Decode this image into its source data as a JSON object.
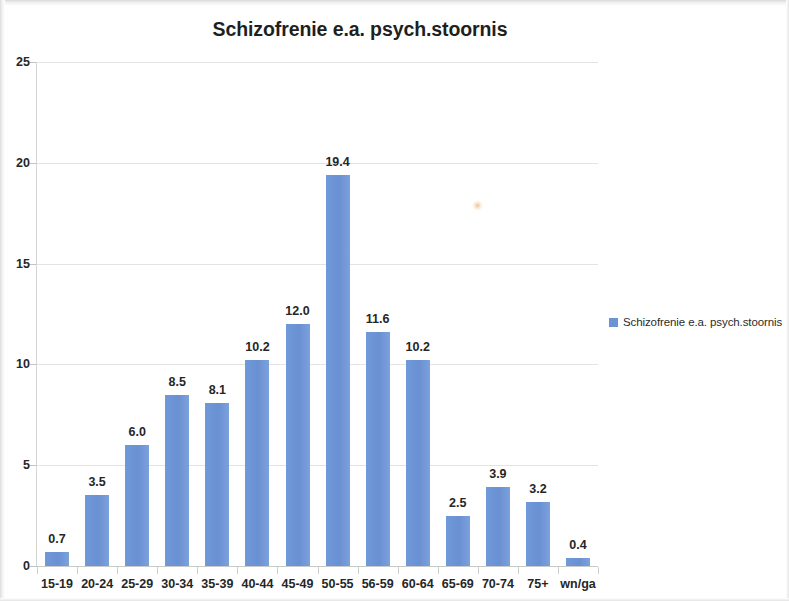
{
  "chart_data": {
    "type": "bar",
    "title": "Schizofrenie e.a. psych.stoornis",
    "xlabel": "",
    "ylabel": "",
    "categories": [
      "15-19",
      "20-24",
      "25-29",
      "30-34",
      "35-39",
      "40-44",
      "45-49",
      "50-55",
      "56-59",
      "60-64",
      "65-69",
      "70-74",
      "75+",
      "wn/ga"
    ],
    "values": [
      0.7,
      3.5,
      6.0,
      8.5,
      8.1,
      10.2,
      12.0,
      19.4,
      11.6,
      10.2,
      2.5,
      3.9,
      3.2,
      0.4
    ],
    "value_labels": [
      "0.7",
      "3.5",
      "6.0",
      "8.5",
      "8.1",
      "10.2",
      "12.0",
      "19.4",
      "11.6",
      "10.2",
      "2.5",
      "3.9",
      "3.2",
      "0.4"
    ],
    "ylim": [
      0,
      25
    ],
    "yticks": [
      0,
      5,
      10,
      15,
      20,
      25
    ],
    "ytick_labels": [
      "0",
      "5",
      "10",
      "15",
      "20",
      "25"
    ],
    "grid": true,
    "legend_position": "right",
    "series": [
      {
        "name": "Schizofrenie e.a. psych.stoornis",
        "color": "#6c93d6",
        "values": [
          0.7,
          3.5,
          6.0,
          8.5,
          8.1,
          10.2,
          12.0,
          19.4,
          11.6,
          10.2,
          2.5,
          3.9,
          3.2,
          0.4
        ]
      }
    ]
  },
  "legend": {
    "entries": [
      {
        "label": "Schizofrenie e.a. psych.stoornis",
        "color": "#6c93d6"
      }
    ]
  },
  "colors": {
    "bar": "#6c93d6",
    "gridline": "#e3e3e3",
    "axis": "#c9c9c9",
    "text": "#262626"
  }
}
